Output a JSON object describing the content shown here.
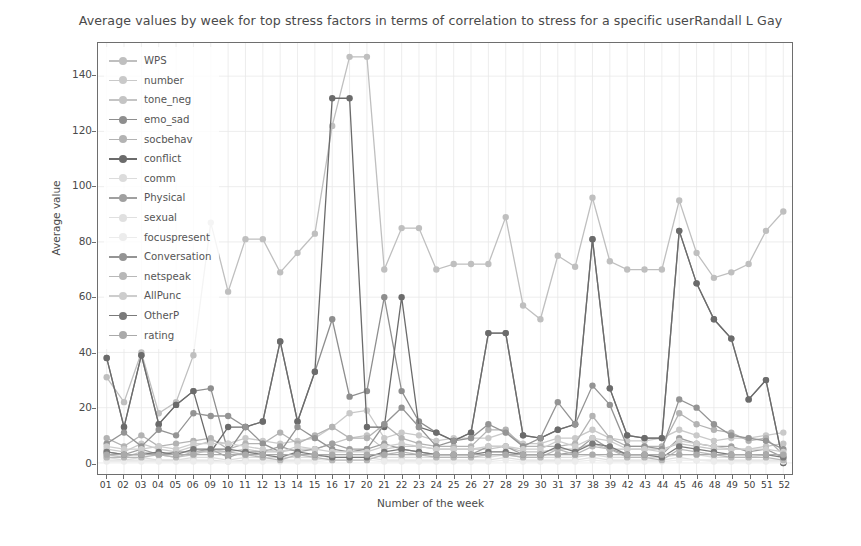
{
  "chart_data": {
    "type": "line",
    "title": "Average values by week for top stress factors in terms of correlation to stress for a specific userRandall L Gay",
    "xlabel": "Number of the week",
    "ylabel": "Average value",
    "grid": true,
    "legend_position": "upper left",
    "ylim": [
      -4,
      152
    ],
    "yticks": [
      0,
      20,
      40,
      60,
      80,
      100,
      120,
      140
    ],
    "ytick_labels": [
      "0",
      "20",
      "40",
      "60",
      "80",
      "100",
      "120",
      "140"
    ],
    "categories": [
      "01",
      "02",
      "03",
      "04",
      "05",
      "06",
      "09",
      "10",
      "11",
      "12",
      "13",
      "14",
      "15",
      "16",
      "17",
      "20",
      "21",
      "22",
      "23",
      "24",
      "25",
      "26",
      "27",
      "28",
      "29",
      "30",
      "31",
      "37",
      "38",
      "39",
      "42",
      "43",
      "44",
      "45",
      "46",
      "48",
      "49",
      "50",
      "51",
      "52"
    ],
    "series": [
      {
        "name": "WPS",
        "color": "#bfbfbf",
        "values": [
          31.0,
          22.0,
          40.0,
          18.0,
          22.0,
          39.0,
          87.0,
          62.0,
          81.0,
          81.0,
          69.0,
          76.0,
          83.0,
          122.0,
          147.0,
          147.0,
          70.0,
          85.0,
          85.0,
          70.0,
          72.0,
          72.0,
          72.0,
          89.0,
          57.0,
          52.0,
          75.0,
          71.0,
          96.0,
          73.0,
          70.0,
          70.0,
          70.0,
          95.0,
          76.0,
          67.0,
          69.0,
          72.0,
          84.0,
          91.0
        ]
      },
      {
        "name": "number",
        "color": "#c9c9c9",
        "values": [
          5.0,
          4.0,
          7.0,
          5.0,
          4.0,
          6.0,
          8.0,
          7.0,
          9.0,
          8.0,
          7.0,
          8.0,
          9.0,
          13.0,
          18.0,
          19.0,
          9.0,
          11.0,
          10.0,
          8.0,
          9.0,
          9.0,
          9.0,
          11.0,
          7.0,
          7.0,
          9.0,
          9.0,
          12.0,
          9.0,
          8.0,
          8.0,
          9.0,
          12.0,
          10.0,
          8.0,
          9.0,
          9.0,
          10.0,
          11.0
        ]
      },
      {
        "name": "tone_neg",
        "color": "#c4c4c4",
        "values": [
          3.0,
          2.0,
          4.0,
          3.0,
          2.0,
          3.0,
          5.0,
          4.0,
          5.0,
          4.0,
          4.0,
          5.0,
          5.0,
          7.0,
          9.0,
          10.0,
          5.0,
          6.0,
          6.0,
          5.0,
          5.0,
          5.0,
          5.0,
          6.0,
          4.0,
          4.0,
          5.0,
          5.0,
          7.0,
          5.0,
          5.0,
          5.0,
          5.0,
          7.0,
          6.0,
          5.0,
          5.0,
          5.0,
          6.0,
          7.0
        ]
      },
      {
        "name": "emo_sad",
        "color": "#8e8e8e",
        "values": [
          38.0,
          13.0,
          39.0,
          14.0,
          21.0,
          26.0,
          27.0,
          4.0,
          13.0,
          15.0,
          44.0,
          15.0,
          33.0,
          52.0,
          24.0,
          26.0,
          60.0,
          26.0,
          15.0,
          11.0,
          8.0,
          11.0,
          47.0,
          47.0,
          10.0,
          9.0,
          12.0,
          14.0,
          81.0,
          27.0,
          10.0,
          9.0,
          9.0,
          84.0,
          65.0,
          52.0,
          45.0,
          23.0,
          30.0,
          0.0
        ]
      },
      {
        "name": "socbehav",
        "color": "#b3b3b3",
        "values": [
          9.0,
          6.0,
          10.0,
          6.0,
          7.0,
          8.0,
          9.0,
          5.0,
          7.0,
          7.0,
          11.0,
          7.0,
          10.0,
          13.0,
          9.0,
          9.0,
          14.0,
          9.0,
          7.0,
          6.0,
          6.0,
          6.0,
          12.0,
          12.0,
          6.0,
          6.0,
          6.0,
          7.0,
          17.0,
          9.0,
          6.0,
          6.0,
          6.0,
          18.0,
          14.0,
          12.0,
          11.0,
          8.0,
          9.0,
          3.0
        ]
      },
      {
        "name": "conflict",
        "color": "#6b6b6b",
        "values": [
          38.0,
          13.0,
          39.0,
          14.0,
          21.0,
          26.0,
          4.0,
          13.0,
          13.0,
          15.0,
          44.0,
          15.0,
          33.0,
          132.0,
          132.0,
          13.0,
          13.0,
          60.0,
          13.0,
          11.0,
          8.0,
          11.0,
          47.0,
          47.0,
          10.0,
          9.0,
          12.0,
          14.0,
          81.0,
          27.0,
          10.0,
          9.0,
          9.0,
          84.0,
          65.0,
          52.0,
          45.0,
          23.0,
          30.0,
          0.0
        ]
      },
      {
        "name": "comm",
        "color": "#dcdcdc",
        "values": [
          2.0,
          1.0,
          2.0,
          1.0,
          1.0,
          2.0,
          2.0,
          1.0,
          2.0,
          2.0,
          2.0,
          2.0,
          2.0,
          3.0,
          3.0,
          3.0,
          2.0,
          2.0,
          2.0,
          2.0,
          2.0,
          2.0,
          2.0,
          3.0,
          2.0,
          2.0,
          2.0,
          2.0,
          3.0,
          2.0,
          2.0,
          2.0,
          2.0,
          3.0,
          3.0,
          2.0,
          2.0,
          2.0,
          3.0,
          3.0
        ]
      },
      {
        "name": "Physical",
        "color": "#a0a0a0",
        "values": [
          4.0,
          3.0,
          5.0,
          3.0,
          4.0,
          4.0,
          5.0,
          2.0,
          4.0,
          4.0,
          6.0,
          4.0,
          5.0,
          7.0,
          5.0,
          5.0,
          7.0,
          5.0,
          4.0,
          3.0,
          3.0,
          3.0,
          6.0,
          6.0,
          3.0,
          3.0,
          3.0,
          4.0,
          9.0,
          5.0,
          3.0,
          3.0,
          3.0,
          9.0,
          7.0,
          6.0,
          6.0,
          4.0,
          5.0,
          2.0
        ]
      },
      {
        "name": "sexual",
        "color": "#e0e0e0",
        "values": [
          1.0,
          1.0,
          1.0,
          1.0,
          1.0,
          1.0,
          1.0,
          0.5,
          1.0,
          1.0,
          1.0,
          1.0,
          1.0,
          2.0,
          2.0,
          2.0,
          1.0,
          1.0,
          1.0,
          1.0,
          1.0,
          1.0,
          1.0,
          2.0,
          1.0,
          1.0,
          1.0,
          1.0,
          2.0,
          1.0,
          1.0,
          1.0,
          1.0,
          2.0,
          1.0,
          1.0,
          1.0,
          1.0,
          1.0,
          1.0
        ]
      },
      {
        "name": "focuspresent",
        "color": "#ececec",
        "values": [
          0.5,
          0.5,
          0.5,
          0.5,
          0.5,
          0.5,
          0.5,
          0.5,
          0.5,
          0.5,
          0.5,
          0.5,
          0.5,
          1.0,
          1.0,
          1.0,
          0.5,
          0.5,
          0.5,
          0.5,
          0.5,
          0.5,
          0.5,
          1.0,
          0.5,
          0.5,
          0.5,
          0.5,
          1.0,
          0.5,
          0.5,
          0.5,
          0.5,
          1.0,
          1.0,
          0.5,
          0.5,
          0.5,
          0.5,
          0.5
        ]
      },
      {
        "name": "Conversation",
        "color": "#949494",
        "values": [
          7.0,
          11.0,
          6.0,
          12.0,
          10.0,
          18.0,
          17.0,
          17.0,
          13.0,
          7.0,
          4.0,
          13.0,
          9.0,
          5.0,
          4.0,
          5.0,
          14.0,
          20.0,
          13.0,
          6.0,
          8.0,
          9.0,
          14.0,
          11.0,
          6.0,
          9.0,
          22.0,
          14.0,
          28.0,
          21.0,
          6.0,
          6.0,
          5.0,
          23.0,
          20.0,
          14.0,
          10.0,
          9.0,
          8.0,
          5.0
        ]
      },
      {
        "name": "netspeak",
        "color": "#b8b8b8",
        "values": [
          2.0,
          2.0,
          2.0,
          3.0,
          2.0,
          4.0,
          4.0,
          4.0,
          3.0,
          2.0,
          1.0,
          3.0,
          2.0,
          1.0,
          1.0,
          1.0,
          3.0,
          4.0,
          3.0,
          2.0,
          2.0,
          2.0,
          3.0,
          3.0,
          2.0,
          2.0,
          5.0,
          3.0,
          6.0,
          5.0,
          2.0,
          2.0,
          1.0,
          5.0,
          4.0,
          3.0,
          2.0,
          2.0,
          2.0,
          1.0
        ]
      },
      {
        "name": "AllPunc",
        "color": "#cdcdcd",
        "values": [
          6.0,
          5.0,
          5.0,
          6.0,
          5.0,
          7.0,
          7.0,
          7.0,
          6.0,
          5.0,
          4.0,
          6.0,
          5.0,
          4.0,
          4.0,
          4.0,
          6.0,
          7.0,
          6.0,
          5.0,
          5.0,
          5.0,
          6.0,
          6.0,
          5.0,
          5.0,
          8.0,
          6.0,
          9.0,
          8.0,
          5.0,
          5.0,
          4.0,
          8.0,
          7.0,
          6.0,
          5.0,
          5.0,
          5.0,
          4.0
        ]
      },
      {
        "name": "OtherP",
        "color": "#7a7a7a",
        "values": [
          4.0,
          3.0,
          3.0,
          4.0,
          3.0,
          5.0,
          5.0,
          5.0,
          4.0,
          3.0,
          2.0,
          4.0,
          3.0,
          2.0,
          2.0,
          2.0,
          4.0,
          5.0,
          4.0,
          3.0,
          3.0,
          3.0,
          4.0,
          4.0,
          3.0,
          3.0,
          6.0,
          4.0,
          7.0,
          6.0,
          3.0,
          3.0,
          2.0,
          6.0,
          5.0,
          4.0,
          3.0,
          3.0,
          3.0,
          2.0
        ]
      },
      {
        "name": "rating",
        "color": "#aaaaaa",
        "values": [
          3.0,
          3.0,
          3.0,
          3.0,
          3.0,
          3.0,
          3.0,
          3.0,
          3.0,
          3.0,
          3.0,
          3.0,
          3.0,
          3.0,
          3.0,
          3.0,
          3.0,
          3.0,
          3.0,
          3.0,
          3.0,
          3.0,
          3.0,
          3.0,
          3.0,
          3.0,
          3.0,
          3.0,
          3.0,
          3.0,
          3.0,
          3.0,
          3.0,
          3.0,
          3.0,
          3.0,
          3.0,
          3.0,
          3.0,
          3.0
        ]
      }
    ]
  },
  "style": {
    "axis_color": "#6e6e6e",
    "grid_color": "#e8e8e8",
    "text_color": "#4a4a4a",
    "background": "#ffffff"
  }
}
